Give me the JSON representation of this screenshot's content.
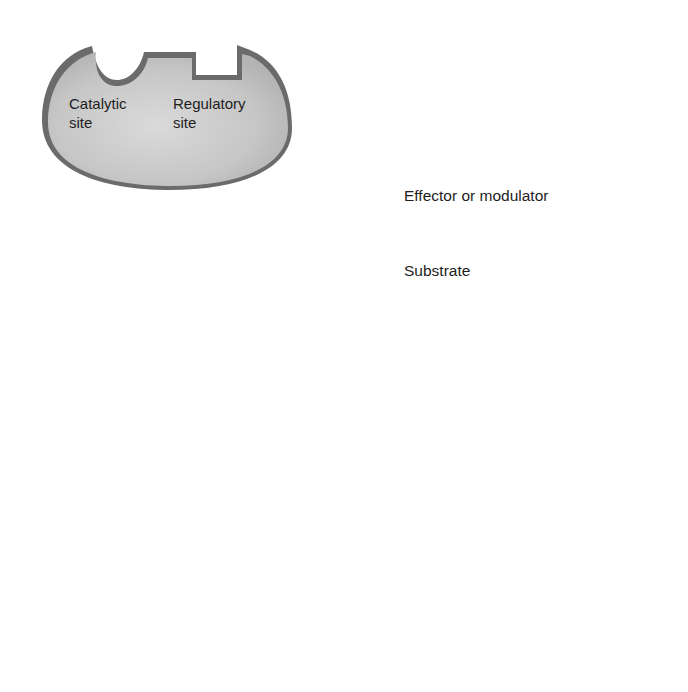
{
  "diagram": {
    "type": "allosteric-enzyme-activation",
    "steps": [
      {
        "id": "step-1",
        "description": "Enzyme with empty catalytic and regulatory sites"
      },
      {
        "id": "step-2",
        "description": "Effector binds regulatory site"
      },
      {
        "id": "step-3",
        "description": "Catalytic site changes shape"
      },
      {
        "id": "step-4",
        "description": "Substrate binds catalytic site"
      }
    ],
    "site_labels": {
      "catalytic_line1": "Catalytic",
      "catalytic_line2": "site",
      "regulatory_line1": "Regulatory",
      "regulatory_line2": "site"
    },
    "legend": {
      "effector": "Effector or modulator",
      "substrate": "Substrate"
    },
    "colors": {
      "enzyme_fill": "#c8c8c8",
      "enzyme_edge": "#6b6b6b",
      "arrow": "#111111",
      "text": "#1e1e1e"
    }
  }
}
